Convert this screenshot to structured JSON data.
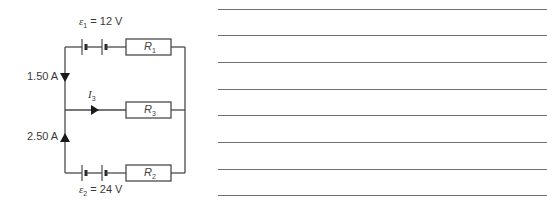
{
  "circuit": {
    "emf1": {
      "symbol": "ε",
      "subscript": "1",
      "value": "= 12 V"
    },
    "emf2": {
      "symbol": "ε",
      "subscript": "2",
      "value": "= 24 V"
    },
    "current_top_label": "1.50 A",
    "current_bottom_label": "2.50 A",
    "current_middle": {
      "symbol": "I",
      "subscript": "3"
    },
    "resistors": [
      {
        "symbol": "R",
        "subscript": "1"
      },
      {
        "symbol": "R",
        "subscript": "3"
      },
      {
        "symbol": "R",
        "subscript": "2"
      }
    ],
    "wire_color": "#4a4a4a"
  },
  "answer_area": {
    "line_count": 8,
    "line_color": "#707070"
  }
}
